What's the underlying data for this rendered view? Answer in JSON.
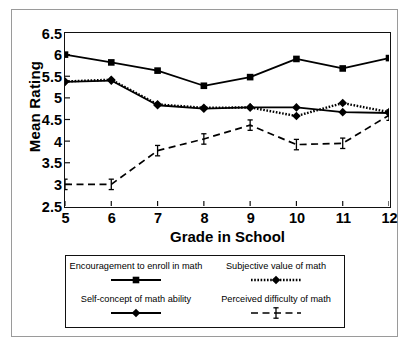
{
  "chart_data": {
    "type": "line",
    "title": "",
    "xlabel": "Grade in School",
    "ylabel": "Mean Rating",
    "categories": [
      5,
      6,
      7,
      8,
      9,
      10,
      11,
      12
    ],
    "x": [
      5,
      6,
      7,
      8,
      9,
      10,
      11,
      12
    ],
    "xlim": [
      5,
      12
    ],
    "ylim": [
      2.5,
      6.5
    ],
    "ytick_labels": [
      "6.5",
      "6",
      "5.5",
      "5",
      "4.5",
      "4",
      "3.5",
      "3",
      "2.5"
    ],
    "ytick_values": [
      6.5,
      6,
      5.5,
      5,
      4.5,
      4,
      3.5,
      3,
      2.5
    ],
    "xtick_labels": [
      "5",
      "6",
      "7",
      "8",
      "9",
      "10",
      "11",
      "12"
    ],
    "grid": false,
    "legend_position": "bottom",
    "series": [
      {
        "name": "Encouragement to enroll in math",
        "marker": "square",
        "line_style": "solid",
        "color": "#000000",
        "values": [
          6.0,
          5.82,
          5.63,
          5.28,
          5.48,
          5.9,
          5.68,
          5.92
        ]
      },
      {
        "name": "Subjective value of math",
        "marker": "diamond",
        "line_style": "dotted",
        "color": "#000000",
        "values": [
          5.38,
          5.42,
          4.85,
          4.77,
          4.78,
          4.58,
          4.88,
          4.67
        ]
      },
      {
        "name": "Self-concept of math ability",
        "marker": "diamond",
        "line_style": "solid",
        "color": "#000000",
        "values": [
          5.37,
          5.4,
          4.83,
          4.75,
          4.78,
          4.78,
          4.67,
          4.65
        ]
      },
      {
        "name": "Perceived difficulty of math",
        "marker": "ibeam",
        "line_style": "dashed",
        "color": "#000000",
        "values": [
          3.0,
          3.0,
          3.78,
          4.05,
          4.37,
          3.92,
          3.95,
          4.6
        ]
      }
    ]
  },
  "legend": {
    "items": [
      {
        "label": "Encouragement to enroll in math",
        "key": "solid-square-key"
      },
      {
        "label": "Subjective value of math",
        "key": "dotted-diamond-key"
      },
      {
        "label": "Self-concept of math ability",
        "key": "solid-diamond-key"
      },
      {
        "label": "Perceived difficulty of math",
        "key": "dashed-ibeam-key"
      }
    ]
  }
}
